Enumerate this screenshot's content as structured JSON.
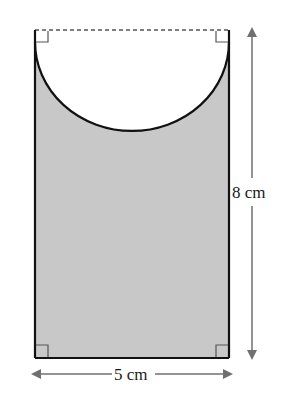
{
  "diagram": {
    "type": "geometry",
    "width_label": "5 cm",
    "height_label": "8 cm",
    "shape": {
      "rectangle": {
        "width_cm": 5,
        "height_cm": 8
      },
      "semicircle": {
        "diameter_cm": 5,
        "position": "top, cut out"
      }
    },
    "colors": {
      "shaded": "#c8c8c8",
      "outline": "#111111",
      "arrow": "#707070",
      "dashed": "#555555"
    },
    "right_angle_markers": [
      "top-left",
      "top-right",
      "bottom-left",
      "bottom-right"
    ]
  }
}
